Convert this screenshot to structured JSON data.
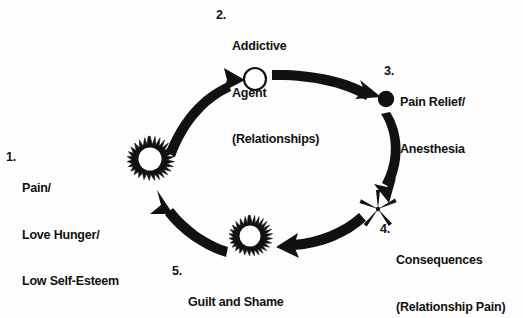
{
  "diagram": {
    "background_color": "#fdfdfd",
    "ink_color": "#111111",
    "nodes": [
      {
        "id": "node-1",
        "number": "1.",
        "lines": [
          "Pain/",
          "Love Hunger/",
          "Low Self-Esteem"
        ],
        "glyph": "starburst",
        "glyph_fill": "#ffffff",
        "glyph_stroke": "#111111",
        "cx": 150,
        "cy": 160,
        "r": 24
      },
      {
        "id": "node-2",
        "number": "2.",
        "lines": [
          "Addictive",
          "Agent",
          "(Relationships)"
        ],
        "glyph": "hollow-circle",
        "glyph_fill": "#ffffff",
        "glyph_stroke": "#111111",
        "cx": 255,
        "cy": 79,
        "r": 11
      },
      {
        "id": "node-3",
        "number": "3.",
        "lines": [
          "Pain Relief/",
          "Anesthesia"
        ],
        "glyph": "filled-circle",
        "glyph_fill": "#111111",
        "glyph_stroke": "#111111",
        "cx": 386,
        "cy": 99,
        "r": 8
      },
      {
        "id": "node-4",
        "number": "4.",
        "lines": [
          "Consequences",
          "(Relationship Pain)"
        ],
        "glyph": "five-point-star-spikes",
        "glyph_fill": "#111111",
        "glyph_stroke": "#111111",
        "cx": 378,
        "cy": 209,
        "r": 17
      },
      {
        "id": "node-5",
        "number": "5.",
        "lines": [
          "Guilt and Shame"
        ],
        "glyph": "starburst",
        "glyph_fill": "#ffffff",
        "glyph_stroke": "#111111",
        "cx": 250,
        "cy": 237,
        "r": 22
      }
    ],
    "arrows": [
      {
        "id": "arrow-1-to-2",
        "from": "node-1",
        "to": "node-2",
        "direction": "clockwise-up-right"
      },
      {
        "id": "arrow-2-to-3",
        "from": "node-2",
        "to": "node-3",
        "direction": "clockwise-right-down"
      },
      {
        "id": "arrow-3-to-4",
        "from": "node-3",
        "to": "node-4",
        "direction": "clockwise-down"
      },
      {
        "id": "arrow-4-to-5",
        "from": "node-4",
        "to": "node-5",
        "direction": "clockwise-down-left"
      },
      {
        "id": "arrow-5-to-1",
        "from": "node-5",
        "to": "node-1",
        "direction": "clockwise-left-up"
      }
    ]
  }
}
